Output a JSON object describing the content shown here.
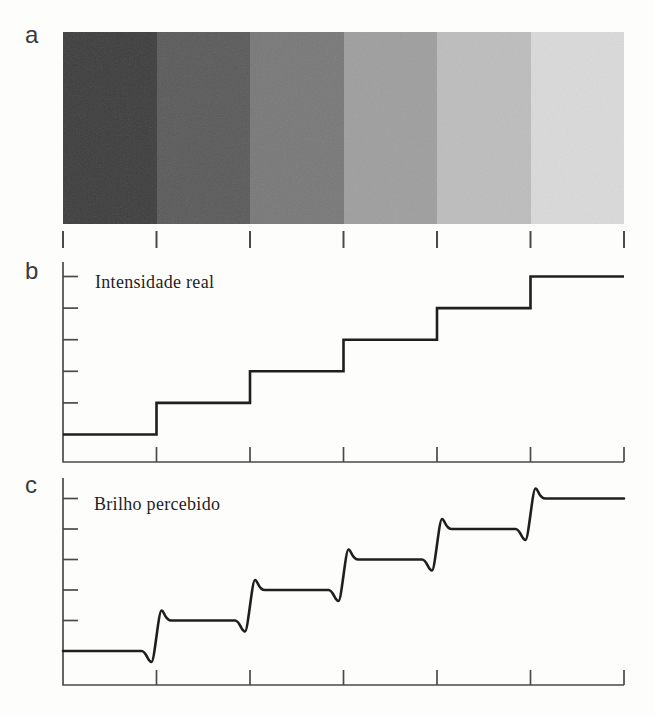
{
  "panels": {
    "a": {
      "label": "a"
    },
    "b": {
      "label": "b",
      "title": "Intensidade real"
    },
    "c": {
      "label": "c",
      "title": "Brilho percebido"
    }
  },
  "colors": {
    "background": "#fdfdfc",
    "axis": "#4a4a4a",
    "curve": "#1f1f1f",
    "text": "#1f1f1f",
    "panel_letter": "#3a3a3a"
  },
  "chart_data": [
    {
      "panel": "a",
      "type": "heatmap",
      "title": "",
      "description": "Horizontal strip of six uniform vertical gray bands, dark to light, with film grain; seven boundary tick marks below",
      "n_bands": 6,
      "band_colors": [
        "#3d3d3d",
        "#5a5a5a",
        "#787878",
        "#9e9e9e",
        "#bdbdbd",
        "#dadada"
      ],
      "band_intensities": [
        0.24,
        0.35,
        0.47,
        0.62,
        0.74,
        0.85
      ],
      "boundary_ticks": 7
    },
    {
      "panel": "b",
      "type": "line",
      "title": "Intensidade real",
      "style": "staircase",
      "xlim": [
        0,
        6
      ],
      "ylim": [
        0,
        6.5
      ],
      "x_edges": [
        0,
        1,
        2,
        3,
        4,
        5,
        6
      ],
      "step_levels": [
        1,
        2,
        3,
        4,
        5,
        6
      ],
      "y_ticks_at_levels": [
        2,
        3,
        4,
        5,
        6
      ],
      "x_ticks_at_edges": [
        1,
        2,
        3,
        4,
        5,
        6
      ],
      "grid": false,
      "legend": false
    },
    {
      "panel": "c",
      "type": "line",
      "title": "Brilho percebido",
      "style": "staircase-with-mach-band-overshoot",
      "xlim": [
        0,
        6
      ],
      "ylim": [
        0,
        6.5
      ],
      "x_edges": [
        0,
        1,
        2,
        3,
        4,
        5,
        6
      ],
      "step_levels": [
        1,
        2,
        3,
        4,
        5,
        6
      ],
      "undershoot_fraction_of_step": 0.36,
      "overshoot_fraction_of_step": 0.33,
      "y_ticks_at_levels": [
        2,
        3,
        4,
        5,
        6
      ],
      "x_ticks_at_edges": [
        1,
        2,
        3,
        4,
        5,
        6
      ],
      "grid": false,
      "legend": false
    }
  ]
}
